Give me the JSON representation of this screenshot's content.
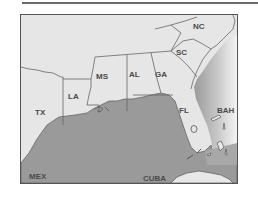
{
  "map": {
    "colors": {
      "land": "#e6e6e6",
      "water": "#9a9a9a",
      "ocean_fade": "#f2f2f2",
      "border": "#666666",
      "label": "#4a4a4a"
    },
    "labels": {
      "nc": "NC",
      "sc": "SC",
      "ga": "GA",
      "al": "AL",
      "ms": "MS",
      "la": "LA",
      "tx": "TX",
      "fl": "FL",
      "bah": "BAH",
      "mex": "MEX",
      "cuba": "CUBA"
    }
  }
}
